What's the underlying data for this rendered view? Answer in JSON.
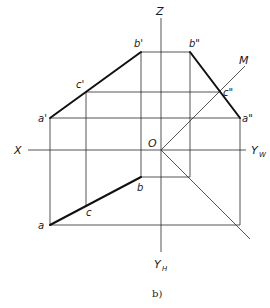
{
  "figure": {
    "caption": "b)"
  },
  "axes": {
    "z_label": "Z",
    "x_label": "X",
    "yw_label": "Y",
    "yw_sub": "W",
    "yh_label": "Y",
    "yh_sub": "H",
    "origin_label": "O",
    "miter_label": "M"
  },
  "points": {
    "a_front": "a'",
    "b_front": "b'",
    "c_front": "c'",
    "a_side": "a\"",
    "b_side": "b\"",
    "c_side": "c\"",
    "a_top": "a",
    "b_top": "b",
    "c_top": "c"
  },
  "colors": {
    "line": "#2a2a2a",
    "segment": "#111111",
    "background": "#ffffff"
  }
}
